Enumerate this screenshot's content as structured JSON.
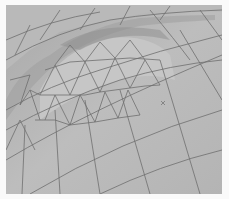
{
  "scene": {
    "description": "3D rendered mesh surface wireframe (shaded gray with triangulated dome region)",
    "colors": {
      "background": "#fafafa",
      "surface_light": "#c8c8c8",
      "surface_mid": "#b5b5b5",
      "surface_dark": "#9a9a9a",
      "edge": "#6e6e6e"
    },
    "marker": "x"
  }
}
